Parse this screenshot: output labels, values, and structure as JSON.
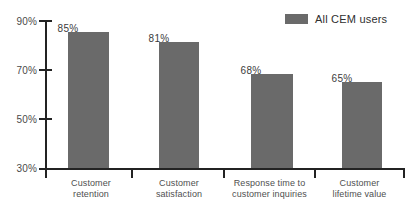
{
  "chart_data": {
    "type": "bar",
    "title": "",
    "xlabel": "",
    "ylabel": "",
    "ylim": [
      30,
      90
    ],
    "ytick_labels": [
      "90%",
      "70%",
      "50%",
      "30%"
    ],
    "yticks": [
      90,
      70,
      50,
      30
    ],
    "grid": false,
    "legend_position": "top-right",
    "categories": [
      "Customer retention",
      "Customer satisfaction",
      "Response time to customer inquiries",
      "Customer lifetime value"
    ],
    "category_lines": [
      [
        "Customer",
        "retention"
      ],
      [
        "Customer",
        "satisfaction"
      ],
      [
        "Response time to",
        "customer inquiries"
      ],
      [
        "Customer",
        "lifetime value"
      ]
    ],
    "series": [
      {
        "name": "All CEM users",
        "color": "#6a6a6a",
        "values": [
          85,
          81,
          68,
          65
        ],
        "value_labels": [
          "85%",
          "81%",
          "68%",
          "65%"
        ]
      }
    ]
  },
  "legend": {
    "label": "All CEM users",
    "swatch_color": "#6a6a6a"
  },
  "axis": {
    "color": "#232323",
    "y_labels": [
      "90%",
      "70%",
      "50%",
      "30%"
    ]
  }
}
